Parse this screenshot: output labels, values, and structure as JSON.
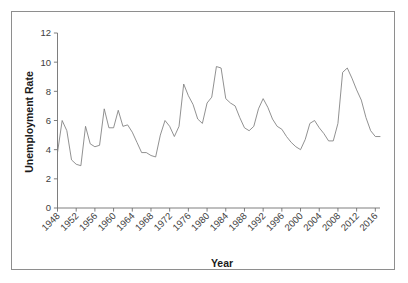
{
  "chart_data": {
    "type": "line",
    "title": "",
    "xlabel": "Year",
    "ylabel": "Unemployment Rate",
    "xlim": [
      1948,
      2017
    ],
    "ylim": [
      0,
      12
    ],
    "grid": false,
    "legend": null,
    "y_ticks": [
      0,
      2,
      4,
      6,
      8,
      10,
      12
    ],
    "y_tick_labels": [
      "0",
      "2",
      "4",
      "6",
      "8",
      "10",
      "12"
    ],
    "x_ticks": [
      1948,
      1952,
      1956,
      1960,
      1964,
      1968,
      1972,
      1976,
      1980,
      1984,
      1988,
      1992,
      1996,
      2000,
      2004,
      2008,
      2012,
      2016
    ],
    "x_tick_labels": [
      "1948",
      "1952",
      "1956",
      "1960",
      "1964",
      "1968",
      "1972",
      "1976",
      "1980",
      "1984",
      "1988",
      "1992",
      "1996",
      "2000",
      "2004",
      "2008",
      "2012",
      "2016"
    ],
    "x_tick_label_rotation": 45,
    "series": [
      {
        "name": "Unemployment Rate",
        "color": "#7d7d7d",
        "x": [
          1948,
          1949,
          1950,
          1951,
          1952,
          1953,
          1954,
          1955,
          1956,
          1957,
          1958,
          1959,
          1960,
          1961,
          1962,
          1963,
          1964,
          1965,
          1966,
          1967,
          1968,
          1969,
          1970,
          1971,
          1972,
          1973,
          1974,
          1975,
          1976,
          1977,
          1978,
          1979,
          1980,
          1981,
          1982,
          1983,
          1984,
          1985,
          1986,
          1987,
          1988,
          1989,
          1990,
          1991,
          1992,
          1993,
          1994,
          1995,
          1996,
          1997,
          1998,
          1999,
          2000,
          2001,
          2002,
          2003,
          2004,
          2005,
          2006,
          2007,
          2008,
          2009,
          2010,
          2011,
          2012,
          2013,
          2014,
          2015,
          2016,
          2017
        ],
        "values": [
          3.8,
          6.0,
          5.3,
          3.3,
          3.0,
          2.9,
          5.6,
          4.4,
          4.2,
          4.3,
          6.8,
          5.5,
          5.5,
          6.7,
          5.6,
          5.7,
          5.2,
          4.5,
          3.8,
          3.8,
          3.6,
          3.5,
          5.0,
          6.0,
          5.6,
          4.9,
          5.6,
          8.5,
          7.7,
          7.1,
          6.1,
          5.8,
          7.2,
          7.6,
          9.7,
          9.6,
          7.5,
          7.2,
          7.0,
          6.2,
          5.5,
          5.3,
          5.6,
          6.8,
          7.5,
          6.9,
          6.1,
          5.6,
          5.4,
          4.9,
          4.5,
          4.2,
          4.0,
          4.7,
          5.8,
          6.0,
          5.5,
          5.1,
          4.6,
          4.6,
          5.8,
          9.3,
          9.6,
          8.9,
          8.1,
          7.4,
          6.2,
          5.3,
          4.9,
          4.9
        ]
      }
    ]
  },
  "axes": {
    "y_title": "Unemployment Rate",
    "x_title": "Year"
  }
}
